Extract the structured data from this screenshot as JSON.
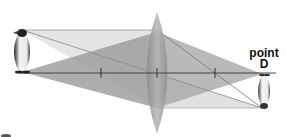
{
  "diagram": {
    "labels": {
      "point_line1": "point",
      "point_line2": "D"
    },
    "object": "penguin (upright)",
    "image": "penguin (inverted, real image)",
    "elements": [
      "object",
      "principal axis",
      "convex lens",
      "focal points (F, 2F marks)",
      "ray cones",
      "image"
    ],
    "colors": {
      "axis": "#444444",
      "lens": "#9a9a9a",
      "cone_dark": "#8c8c8c",
      "cone_light": "#d8d8d8"
    }
  }
}
